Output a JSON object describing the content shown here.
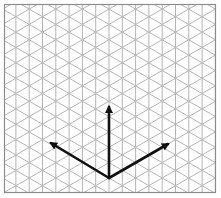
{
  "diagram": {
    "grid": {
      "type": "isometric-triangular",
      "line_color": "#b4b4b4",
      "border_color": "#8c8c8c",
      "frame": {
        "left": 4,
        "top": 4,
        "right": 216,
        "bottom": 193
      },
      "vertical_spacing_px": 13.3
    },
    "axes": {
      "color": "#111111",
      "origin": {
        "x": 109,
        "y": 178
      },
      "vectors": [
        {
          "name": "up",
          "tip": {
            "x": 109,
            "y": 107
          }
        },
        {
          "name": "left",
          "tip": {
            "x": 51,
            "y": 143
          }
        },
        {
          "name": "right",
          "tip": {
            "x": 168,
            "y": 144
          }
        }
      ]
    }
  }
}
